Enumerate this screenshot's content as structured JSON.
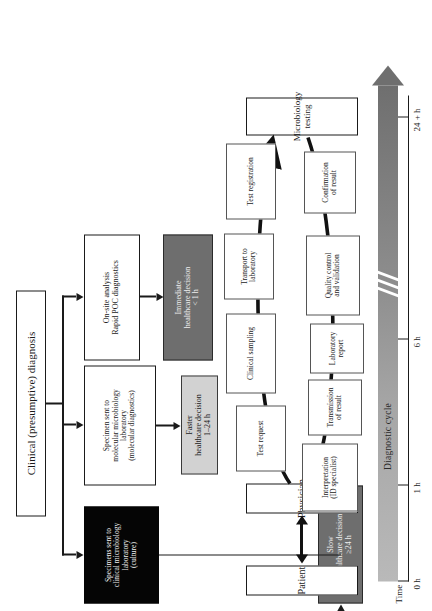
{
  "figure": {
    "orientation": "rotated-90-ccw",
    "panel_top": {
      "name": "diagnostic-pathways-flowchart",
      "root_box": {
        "label": "Clinical (presumptive) diagnosis"
      },
      "pathways": [
        {
          "id": "poc",
          "process_label": "On-site analysis\nRapid POC diagnostics",
          "process_line1": "On-site analysis",
          "process_line2": "Rapid POC diagnostics",
          "outcome_line1": "Immediate",
          "outcome_line2": "healthcare decision",
          "outcome_line3": "< 1 h",
          "outcome_style": "dark-grey"
        },
        {
          "id": "molecular",
          "process_line1": "Specimen sent to",
          "process_line2": "molecular microbiology",
          "process_line3": "laboratory",
          "process_line4": "(molecular diagnostics)",
          "outcome_line1": "Faster",
          "outcome_line2": "healthcare decision",
          "outcome_line3": "1–24 h",
          "outcome_style": "light-grey"
        },
        {
          "id": "culture",
          "process_line1": "Specimens sent to",
          "process_line2": "clinical microbiology",
          "process_line3": "laboratory",
          "process_line4": "(culture)",
          "process_style": "black",
          "outcome_line1": "Slow",
          "outcome_line2": "healthcare decision",
          "outcome_line3": "≥24 h",
          "outcome_style": "dark-grey"
        }
      ]
    },
    "panel_bottom": {
      "name": "diagnostic-cycle",
      "actors": [
        {
          "label": "Patient"
        },
        {
          "label": "Physician"
        },
        {
          "label": "Microbiology\ntesting",
          "line1": "Microbiology",
          "line2": "testing"
        }
      ],
      "cycle_steps_outbound": [
        {
          "label": "Test request",
          "line1": "Test request"
        },
        {
          "label": "Clinical sampling",
          "line1": "Clinical sampling"
        },
        {
          "label": "Transport to laboratory",
          "line1": "Transport to",
          "line2": "laboratory"
        },
        {
          "label": "Test registration",
          "line1": "Test registration"
        }
      ],
      "cycle_steps_return": [
        {
          "label": "Confirmation of result",
          "line1": "Confirmation",
          "line2": "of result"
        },
        {
          "label": "Quality control and validation",
          "line1": "Quality control",
          "line2": "and validation"
        },
        {
          "label": "Laboratory report",
          "line1": "Laboratory",
          "line2": "report"
        },
        {
          "label": "Transmission of result",
          "line1": "Transmission",
          "line2": "of result"
        },
        {
          "label": "Interpretation (ID specialist)",
          "line1": "Interpretation",
          "line2": "(ID specialist)"
        }
      ],
      "time_axis": {
        "caption": "Time",
        "ticks": [
          "0 h",
          "1 h",
          "6 h",
          "24 + h"
        ],
        "arrow_label": "Diagnostic cycle"
      }
    }
  },
  "colors": {
    "ink": "#1a1a1a",
    "dark_grey_box": "#6e6e6e",
    "light_grey_box": "#d2d2d2",
    "black_box": "#050505",
    "arrow_gradient_start": "#b9b9b9",
    "arrow_gradient_end": "#6f6f6f"
  }
}
